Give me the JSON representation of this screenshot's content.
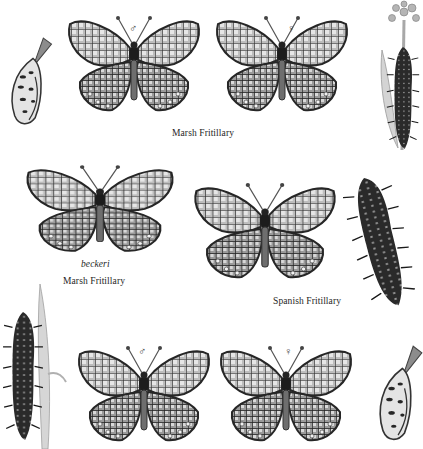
{
  "plate": {
    "captions": {
      "marsh_top": "Marsh Fritillary",
      "beckeri": "beckeri",
      "marsh_mid": "Marsh Fritillary",
      "spanish": "Spanish Fritillary"
    },
    "sex_symbols": {
      "male": "♂",
      "female": "♀"
    },
    "figures": [
      {
        "id": "marsh-male-top",
        "kind": "butterfly",
        "sex": "male"
      },
      {
        "id": "marsh-female-top",
        "kind": "butterfly",
        "sex": "female"
      },
      {
        "id": "marsh-beckeri",
        "kind": "butterfly"
      },
      {
        "id": "spanish",
        "kind": "butterfly"
      },
      {
        "id": "bottom-male",
        "kind": "butterfly",
        "sex": "male"
      },
      {
        "id": "bottom-female",
        "kind": "butterfly",
        "sex": "female"
      },
      {
        "id": "pupa-top-left",
        "kind": "pupa"
      },
      {
        "id": "pupa-bottom-right",
        "kind": "pupa"
      },
      {
        "id": "larva-on-plant-top-right",
        "kind": "larva"
      },
      {
        "id": "larva-mid-right",
        "kind": "larva"
      },
      {
        "id": "larva-bottom-left",
        "kind": "larva"
      }
    ],
    "colors": {
      "ink": "#2a2a2a",
      "wing_mid": "#8a8a8a",
      "wing_light": "#cfcfcf",
      "paper": "#ffffff"
    }
  }
}
